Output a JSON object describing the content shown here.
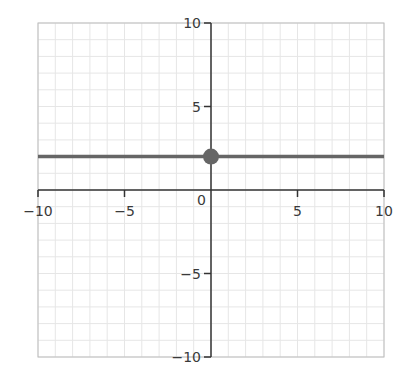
{
  "chart_data": {
    "type": "line",
    "title": "",
    "xlabel": "",
    "ylabel": "",
    "xlim": [
      -10,
      10
    ],
    "ylim": [
      -10,
      10
    ],
    "grid": true,
    "grid_step": 1,
    "x_ticks": [
      -10,
      -5,
      0,
      5,
      10
    ],
    "y_ticks": [
      -10,
      -5,
      5,
      10
    ],
    "x_tick_labels": [
      "−10",
      "−5",
      "0",
      "5",
      "10"
    ],
    "y_tick_labels": [
      "−10",
      "−5",
      "5",
      "10"
    ],
    "series": [
      {
        "name": "y = 2",
        "kind": "horizontal-line",
        "x": [
          -10,
          10
        ],
        "y": [
          2,
          2
        ],
        "color": "#666666"
      }
    ],
    "points": [
      {
        "name": "y-intercept",
        "x": 0,
        "y": 2,
        "color": "#666666"
      }
    ]
  },
  "colors": {
    "grid": "#e6e6e6",
    "axis": "#333333",
    "frame": "#bdbdbd",
    "series": "#666666"
  }
}
